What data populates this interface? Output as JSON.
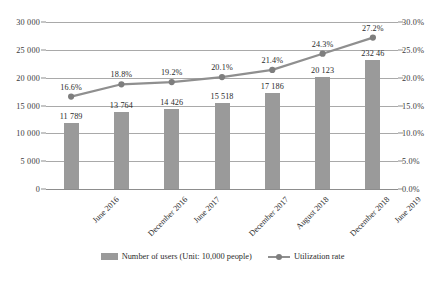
{
  "chart_data": {
    "type": "bar",
    "title": "",
    "subtitle": "",
    "xlabel": "",
    "ylabel": "",
    "categories": [
      "June 2016",
      "December 2016",
      "June 2017",
      "December 2017",
      "August 2018",
      "December 2018",
      "June 2019"
    ],
    "series": [
      {
        "name": "Number of users (Unit: 10,000 people)",
        "type": "bar",
        "axis": "left",
        "color": "#9a9a9a",
        "values": [
          11789,
          13764,
          14426,
          15518,
          17186,
          20123,
          23246
        ],
        "labels": [
          "11 789",
          "13 764",
          "14 426",
          "15 518",
          "17 186",
          "20 123",
          "232 46"
        ]
      },
      {
        "name": "Utilization rate",
        "type": "line",
        "axis": "right",
        "color": "#8f8f8f",
        "values": [
          16.6,
          18.8,
          19.2,
          20.1,
          21.4,
          24.3,
          27.2
        ],
        "labels": [
          "16.6%",
          "18.8%",
          "19.2%",
          "20.1%",
          "21.4%",
          "24.3%",
          "27.2%"
        ]
      }
    ],
    "left_axis": {
      "ylim": [
        0,
        30000
      ],
      "step": 5000,
      "ticks": [
        0,
        5000,
        10000,
        15000,
        20000,
        25000,
        30000
      ],
      "tick_labels": [
        "0",
        "5 000",
        "10 000",
        "15 000",
        "20 000",
        "25 000",
        "30 000"
      ]
    },
    "right_axis": {
      "ylim": [
        0,
        30
      ],
      "step": 5,
      "ticks": [
        0,
        5,
        10,
        15,
        20,
        25,
        30
      ],
      "tick_labels": [
        "0.0%",
        "5.0%",
        "10.0%",
        "15.0%",
        "20.0%",
        "25.0%",
        "30.0%"
      ]
    },
    "grid": true,
    "legend_position": "bottom",
    "legend": [
      {
        "label": "Number of users (Unit: 10,000 people)",
        "marker": "bar-swatch",
        "color": "#9a9a9a"
      },
      {
        "label": "Utilization rate",
        "marker": "line-marker",
        "color": "#8f8f8f"
      }
    ]
  }
}
